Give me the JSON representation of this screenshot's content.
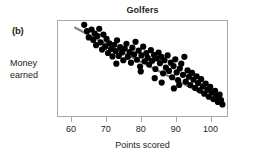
{
  "figure": {
    "panel_label": "(b)",
    "background_color": "#ffffff"
  },
  "chart_data": {
    "type": "scatter",
    "title": "Golfers",
    "xlabel": "Points scored",
    "ylabel_lines": [
      "Money",
      "earned"
    ],
    "ylabel": "Money earned",
    "xlim": [
      56,
      105
    ],
    "ylim": [
      0,
      100
    ],
    "xticks": [
      60,
      70,
      80,
      90,
      100
    ],
    "xticklabels": [
      "60",
      "70",
      "80",
      "90",
      "100"
    ],
    "yticks": [],
    "yticklabels": [],
    "grid": false,
    "legend": null,
    "point_color": "#000000",
    "point_size": 3.1,
    "frame_color": "#a7a9ac",
    "trendline": {
      "visible": true,
      "color": "#808285",
      "width": 2.2,
      "x": [
        61.2,
        103.4
      ],
      "y": [
        92.0,
        13.5
      ]
    },
    "annotations": [],
    "points": [
      [
        63.8,
        95.0
      ],
      [
        64.6,
        88.5
      ],
      [
        65.1,
        82.0
      ],
      [
        65.9,
        90.2
      ],
      [
        66.4,
        79.5
      ],
      [
        66.8,
        86.0
      ],
      [
        67.2,
        74.0
      ],
      [
        67.6,
        83.5
      ],
      [
        68.1,
        91.0
      ],
      [
        68.5,
        77.0
      ],
      [
        68.9,
        69.5
      ],
      [
        69.3,
        85.0
      ],
      [
        69.8,
        72.5
      ],
      [
        70.2,
        80.5
      ],
      [
        70.6,
        66.0
      ],
      [
        71.0,
        76.0
      ],
      [
        71.5,
        70.0
      ],
      [
        71.9,
        62.5
      ],
      [
        72.4,
        74.5
      ],
      [
        72.8,
        68.0
      ],
      [
        73.2,
        79.0
      ],
      [
        73.7,
        63.0
      ],
      [
        74.1,
        72.0
      ],
      [
        74.6,
        66.5
      ],
      [
        75.0,
        58.5
      ],
      [
        75.4,
        70.5
      ],
      [
        75.9,
        75.5
      ],
      [
        76.3,
        62.0
      ],
      [
        76.8,
        67.0
      ],
      [
        77.2,
        56.0
      ],
      [
        77.6,
        71.5
      ],
      [
        78.1,
        64.5
      ],
      [
        78.5,
        77.5
      ],
      [
        78.9,
        59.0
      ],
      [
        79.4,
        68.5
      ],
      [
        79.8,
        52.0
      ],
      [
        80.2,
        63.5
      ],
      [
        80.7,
        72.5
      ],
      [
        81.1,
        57.5
      ],
      [
        81.6,
        66.0
      ],
      [
        82.0,
        61.0
      ],
      [
        82.4,
        54.0
      ],
      [
        82.9,
        69.0
      ],
      [
        83.3,
        58.0
      ],
      [
        83.8,
        64.0
      ],
      [
        84.2,
        49.5
      ],
      [
        84.6,
        60.5
      ],
      [
        85.1,
        66.5
      ],
      [
        85.5,
        55.5
      ],
      [
        85.9,
        62.0
      ],
      [
        86.4,
        45.0
      ],
      [
        86.8,
        58.5
      ],
      [
        87.2,
        51.0
      ],
      [
        87.7,
        63.5
      ],
      [
        88.1,
        47.5
      ],
      [
        88.6,
        56.0
      ],
      [
        89.0,
        41.0
      ],
      [
        89.4,
        52.5
      ],
      [
        89.9,
        59.5
      ],
      [
        90.3,
        46.0
      ],
      [
        90.7,
        38.0
      ],
      [
        91.2,
        50.0
      ],
      [
        91.6,
        55.0
      ],
      [
        92.1,
        43.5
      ],
      [
        92.5,
        62.0
      ],
      [
        92.9,
        36.5
      ],
      [
        93.4,
        48.0
      ],
      [
        93.8,
        41.5
      ],
      [
        94.2,
        33.0
      ],
      [
        94.7,
        45.5
      ],
      [
        95.1,
        38.5
      ],
      [
        95.6,
        30.0
      ],
      [
        96.0,
        42.0
      ],
      [
        96.4,
        35.0
      ],
      [
        96.9,
        27.5
      ],
      [
        97.3,
        39.0
      ],
      [
        97.8,
        31.5
      ],
      [
        98.2,
        24.0
      ],
      [
        98.6,
        34.5
      ],
      [
        99.1,
        28.0
      ],
      [
        99.5,
        21.0
      ],
      [
        99.9,
        31.0
      ],
      [
        100.4,
        25.0
      ],
      [
        100.8,
        18.5
      ],
      [
        101.3,
        27.0
      ],
      [
        101.7,
        21.5
      ],
      [
        102.1,
        15.5
      ],
      [
        102.6,
        23.0
      ],
      [
        103.0,
        17.5
      ],
      [
        103.4,
        13.0
      ],
      [
        86.0,
        35.5
      ],
      [
        89.5,
        29.5
      ],
      [
        73.0,
        55.0
      ],
      [
        80.0,
        47.0
      ],
      [
        84.0,
        40.0
      ],
      [
        91.0,
        33.0
      ]
    ]
  }
}
